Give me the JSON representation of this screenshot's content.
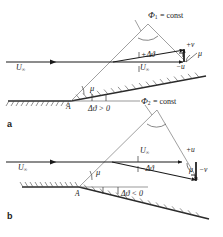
{
  "figure": {
    "panels": [
      {
        "id": "a",
        "panel_label": "a",
        "characteristic_label": "Φ",
        "characteristic_sub": "1",
        "characteristic_eq": "= const",
        "deflection_condition": "Δϑ > 0",
        "vertex_label": "A",
        "mach_angle": "μ",
        "mach_angle_2": "μ",
        "freestream_left": "U",
        "freestream_left_sub": "∞",
        "freestream_right": "U",
        "freestream_right_sub": "∞",
        "delta_theta": "+Δϑ",
        "perturb_v": "+v",
        "perturb_u": "−u"
      },
      {
        "id": "b",
        "panel_label": "b",
        "characteristic_label": "Φ",
        "characteristic_sub": "2",
        "characteristic_eq": "= const",
        "deflection_condition": "Δϑ < 0",
        "vertex_label": "A",
        "mach_angle": "μ",
        "mach_angle_2": "μ",
        "freestream_left": "U",
        "freestream_left_sub": "∞",
        "freestream_right": "U",
        "freestream_right_sub": "∞",
        "delta_theta": "−Δϑ",
        "perturb_v": "−v",
        "perturb_u": "+u"
      }
    ]
  },
  "colors": {
    "ink": "#1a1a1a",
    "thin_line": "#6b6b6b",
    "wall": "#2a2a2a",
    "background": "#ffffff"
  }
}
